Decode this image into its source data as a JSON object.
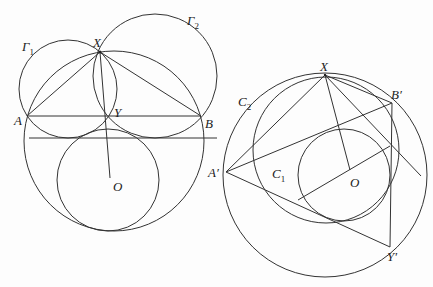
{
  "figures": [
    {
      "id": "left",
      "labels": {
        "gamma1": "Γ",
        "gamma1_sub": "1",
        "gamma2": "Γ",
        "gamma2_sub": "2",
        "X": "X",
        "Y": "Y",
        "A": "A",
        "B": "B",
        "O": "O"
      }
    },
    {
      "id": "right",
      "labels": {
        "X": "X",
        "B_prime": "B′",
        "A_prime": "A′",
        "Y_prime": "Y′",
        "C1": "C",
        "C1_sub": "1",
        "C2": "C",
        "C2_sub": "2",
        "O": "O"
      }
    }
  ],
  "colors": {
    "stroke": "#333333",
    "background": "#fdfdfd"
  }
}
